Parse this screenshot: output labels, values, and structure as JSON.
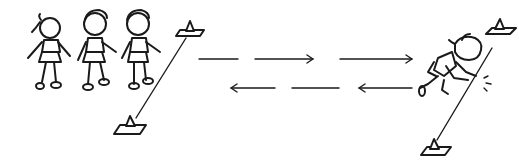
{
  "scene": {
    "description": "Relay running drill illustration",
    "colors": {
      "ink": "#1a1a1a",
      "background": "#ffffff"
    },
    "waiting_children": 3,
    "runner": 1,
    "cone_markers": 4,
    "arrows": {
      "outbound_direction": "right",
      "return_direction": "left"
    }
  }
}
